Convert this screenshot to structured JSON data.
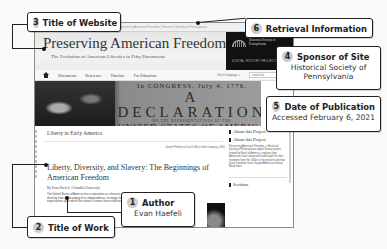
{
  "website": {
    "title": "Preserving American Freedom",
    "subtitle": "The Evolution of American Liberties in Fifty Documents",
    "address_strip": "Preserving American Freedom | Historical Society of Pennsylvania",
    "sponsor_logo": {
      "name": "Historical Society of Pennsylvania",
      "tagline": "DIGITAL HISTORY PROJECTS"
    },
    "nav": {
      "items": [
        "Documents",
        "Reference",
        "Timeline",
        "For Educators"
      ],
      "language_select": "Select Language ▾",
      "search_value": "search site"
    },
    "hero": {
      "line1": "In CONGRESS, July 4, 1776.",
      "line2": "A DECLARATION",
      "line3": "BY THE REPRESENTATIVES OF THE",
      "line4": "UNITED STATES OF AMERICA"
    },
    "section_title": "Liberty in Early America",
    "image_caption": "Jewish Petition to Dutch West India Company, 1655",
    "article": {
      "title": "Liberty, Diversity, and Slavery: The Beginnings of American Freedom",
      "byline": "By Evan Haefeli, Columbia University",
      "body": "The United States of America has a reputation as a beacon of freedom and diversity from the founding of its independence, an image that has fueled expectations upon which the nation's citizens have relied on for centuries..."
    },
    "sidebar": {
      "heading1": "About this Project",
      "heading2": "About this Project",
      "blurb": "Preserving American Freedom, a Historical Society of Pennsylvania digital history project funded by Bank of America, explores how Americans have interpreted and fought for their freedoms from the 1600s to the present and how these freedoms have shaped American history.",
      "read_more": "Read more",
      "sections_heading": "Sections"
    }
  },
  "callouts": [
    {
      "number": "1",
      "label": "Author",
      "value": "Evan Haefeli"
    },
    {
      "number": "2",
      "label": "Title of Work",
      "value": ""
    },
    {
      "number": "3",
      "label": "Title of Website",
      "value": ""
    },
    {
      "number": "4",
      "label": "Sponsor of Site",
      "value": "Historical Society of Pennsylvania"
    },
    {
      "number": "5",
      "label": "Date of Publication",
      "value": "Accessed February 6, 2021"
    },
    {
      "number": "6",
      "label": "Retrieval Information",
      "value": ""
    }
  ]
}
